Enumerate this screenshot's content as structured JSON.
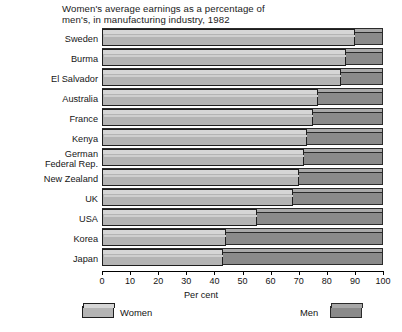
{
  "chart_data": {
    "type": "bar",
    "orientation": "horizontal",
    "title": "Women's average earnings as a percentage of men's, in manufacturing industry, 1982",
    "title_lines": [
      "Women's average earnings as a percentage of",
      "men's, in manufacturing industry, 1982"
    ],
    "xlabel": "Per cent",
    "ylabel": "",
    "xlim": [
      0,
      100
    ],
    "xticks": [
      0,
      10,
      20,
      30,
      40,
      50,
      60,
      70,
      80,
      90,
      100
    ],
    "xtick_labels": [
      "0",
      "10",
      "20",
      "30",
      "40",
      "50",
      "60",
      "70",
      "80",
      "90",
      "100"
    ],
    "grid": false,
    "legend_position": "bottom",
    "categories": [
      "Sweden",
      "Burma",
      "El Salvador",
      "Australia",
      "France",
      "Kenya",
      "German Federal Rep.",
      "New Zealand",
      "UK",
      "USA",
      "Korea",
      "Japan"
    ],
    "category_label_lines": [
      [
        "Sweden"
      ],
      [
        "Burma"
      ],
      [
        "El Salvador"
      ],
      [
        "Australia"
      ],
      [
        "France"
      ],
      [
        "Kenya"
      ],
      [
        "German",
        "Federal Rep."
      ],
      [
        "New Zealand"
      ],
      [
        "UK"
      ],
      [
        "USA"
      ],
      [
        "Korea"
      ],
      [
        "Japan"
      ]
    ],
    "series": [
      {
        "name": "Women",
        "color": "#b4b4b4",
        "values": [
          90,
          87,
          85,
          77,
          75,
          73,
          72,
          70,
          68,
          55,
          44,
          43
        ]
      },
      {
        "name": "Men",
        "color": "#8a8a8a",
        "values": [
          100,
          100,
          100,
          100,
          100,
          100,
          100,
          100,
          100,
          100,
          100,
          100
        ]
      }
    ]
  },
  "legend": {
    "women_label": "Women",
    "men_label": "Men"
  },
  "colors": {
    "women_fill": "#b4b4b4",
    "women_top": "#d6d6d6",
    "men_fill": "#8a8a8a",
    "men_top": "#a8a8a8",
    "outline": "#1e1e1e",
    "background": "#ffffff"
  }
}
